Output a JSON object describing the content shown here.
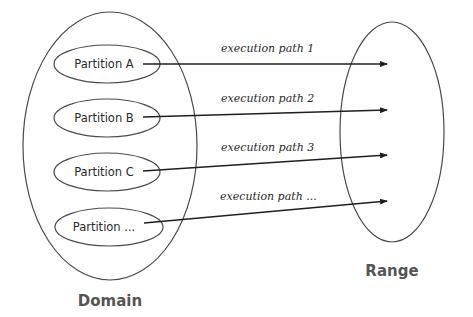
{
  "diagram": {
    "domain": {
      "label": "Domain"
    },
    "range": {
      "label": "Range"
    },
    "partitions": [
      {
        "label": "Partition A"
      },
      {
        "label": "Partition B"
      },
      {
        "label": "Partition C"
      },
      {
        "label": "Partition ..."
      }
    ],
    "paths": [
      {
        "label": "execution path 1",
        "from": "Partition A",
        "to": "Range"
      },
      {
        "label": "execution path 2",
        "from": "Partition B",
        "to": "Range"
      },
      {
        "label": "execution path 3",
        "from": "Partition C",
        "to": "Range"
      },
      {
        "label": "execution path ...",
        "from": "Partition ...",
        "to": "Range"
      }
    ],
    "colors": {
      "stroke": "#4a4a4a",
      "arrow": "#1f1f1f",
      "set_label": "#555555"
    }
  }
}
